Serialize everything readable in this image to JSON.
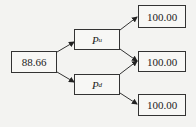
{
  "diagram": {
    "root": {
      "value": "88.66"
    },
    "middle": [
      {
        "label": "P",
        "subscript": "u"
      },
      {
        "label": "P",
        "subscript": "d"
      }
    ],
    "leaves": [
      {
        "value": "100.00"
      },
      {
        "value": "100.00"
      },
      {
        "value": "100.00"
      }
    ],
    "edges": [
      {
        "from": "root",
        "to": "middle.0"
      },
      {
        "from": "root",
        "to": "middle.1"
      },
      {
        "from": "middle.0",
        "to": "leaves.0"
      },
      {
        "from": "middle.0",
        "to": "leaves.1"
      },
      {
        "from": "middle.1",
        "to": "leaves.1"
      },
      {
        "from": "middle.1",
        "to": "leaves.2"
      }
    ]
  }
}
